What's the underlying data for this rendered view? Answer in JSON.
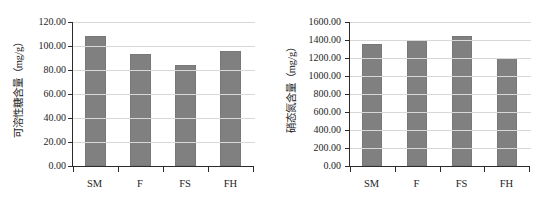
{
  "figure": {
    "background": "#ffffff",
    "bar_color": "#808080",
    "axis_color": "#2b2b2b",
    "grid_color": "#d8d8d8"
  },
  "chart_data": [
    {
      "type": "bar",
      "panel": "left",
      "title": "",
      "xlabel": "",
      "ylabel": "可溶性糖含量（mg/g）",
      "categories": [
        "SM",
        "F",
        "FS",
        "FH"
      ],
      "values": [
        108.0,
        93.5,
        84.0,
        96.0
      ],
      "ylim": [
        0,
        120
      ],
      "yticks": [
        0,
        20,
        40,
        60,
        80,
        100,
        120
      ],
      "ytick_labels": [
        "0.00",
        "20.00",
        "40.00",
        "60.00",
        "80.00",
        "100.00",
        "120.00"
      ],
      "grid": true,
      "legend": "none"
    },
    {
      "type": "bar",
      "panel": "right",
      "title": "",
      "xlabel": "",
      "ylabel": "硝态氮含量（mg/g）",
      "categories": [
        "SM",
        "F",
        "FS",
        "FH"
      ],
      "values": [
        1360,
        1400,
        1440,
        1200
      ],
      "ylim": [
        0,
        1600
      ],
      "yticks": [
        0,
        200,
        400,
        600,
        800,
        1000,
        1200,
        1400,
        1600
      ],
      "ytick_labels": [
        "0.00",
        "200.00",
        "400.00",
        "600.00",
        "800.00",
        "1000.00",
        "1200.00",
        "1400.00",
        "1600.00"
      ],
      "grid": true,
      "legend": "none"
    }
  ]
}
